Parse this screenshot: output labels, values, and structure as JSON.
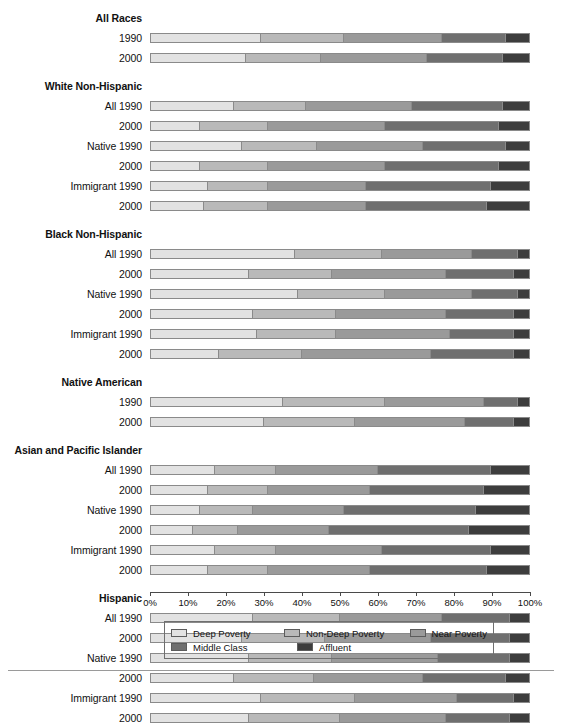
{
  "chart_data": {
    "type": "bar",
    "subtype": "stacked-horizontal-100pct",
    "title": "",
    "xlabel": "",
    "ylabel": "",
    "xlim": [
      0,
      100
    ],
    "grid": false,
    "legend_position": "bottom",
    "series": [
      {
        "name": "Deep Poverty",
        "color": "#e2e2e2"
      },
      {
        "name": "Non-Deep Poverty",
        "color": "#b9b9b9"
      },
      {
        "name": "Near Poverty",
        "color": "#9a9a9a"
      },
      {
        "name": "Middle Class",
        "color": "#6f6f6f"
      },
      {
        "name": "Affluent",
        "color": "#3d3d3d"
      }
    ],
    "tick_labels": [
      "0%",
      "10%",
      "20%",
      "30%",
      "40%",
      "50%",
      "60%",
      "70%",
      "80%",
      "90%",
      "100%"
    ],
    "tick_values": [
      0,
      10,
      20,
      30,
      40,
      50,
      60,
      70,
      80,
      90,
      100
    ],
    "groups": [
      {
        "heading": "All Races",
        "rows": [
          {
            "label": "1990",
            "values": [
              29,
              22,
              26,
              17,
              6
            ]
          },
          {
            "label": "2000",
            "values": [
              25,
              20,
              28,
              20,
              7
            ]
          }
        ]
      },
      {
        "heading": "White Non-Hispanic",
        "rows": [
          {
            "label": "All 1990",
            "values": [
              22,
              19,
              28,
              24,
              7
            ]
          },
          {
            "label": "2000",
            "values": [
              13,
              18,
              31,
              30,
              8
            ]
          },
          {
            "label": "Native 1990",
            "values": [
              24,
              20,
              28,
              22,
              6
            ]
          },
          {
            "label": "2000",
            "values": [
              13,
              18,
              31,
              30,
              8
            ]
          },
          {
            "label": "Immigrant 1990",
            "values": [
              15,
              16,
              26,
              33,
              10
            ]
          },
          {
            "label": "2000",
            "values": [
              14,
              17,
              26,
              32,
              11
            ]
          }
        ]
      },
      {
        "heading": "Black Non-Hispanic",
        "rows": [
          {
            "label": "All 1990",
            "values": [
              38,
              23,
              24,
              12,
              3
            ]
          },
          {
            "label": "2000",
            "values": [
              26,
              22,
              30,
              18,
              4
            ]
          },
          {
            "label": "Native 1990",
            "values": [
              39,
              23,
              23,
              12,
              3
            ]
          },
          {
            "label": "2000",
            "values": [
              27,
              22,
              29,
              18,
              4
            ]
          },
          {
            "label": "Immigrant 1990",
            "values": [
              28,
              21,
              30,
              17,
              4
            ]
          },
          {
            "label": "2000",
            "values": [
              18,
              22,
              34,
              22,
              4
            ]
          }
        ]
      },
      {
        "heading": "Native American",
        "rows": [
          {
            "label": "1990",
            "values": [
              35,
              27,
              26,
              9,
              3
            ]
          },
          {
            "label": "2000",
            "values": [
              30,
              24,
              29,
              13,
              4
            ]
          }
        ]
      },
      {
        "heading": "Asian and Pacific Islander",
        "rows": [
          {
            "label": "All 1990",
            "values": [
              17,
              16,
              27,
              30,
              10
            ]
          },
          {
            "label": "2000",
            "values": [
              15,
              16,
              27,
              30,
              12
            ]
          },
          {
            "label": "Native 1990",
            "values": [
              13,
              14,
              24,
              35,
              14
            ]
          },
          {
            "label": "2000",
            "values": [
              11,
              12,
              24,
              37,
              16
            ]
          },
          {
            "label": "Immigrant 1990",
            "values": [
              17,
              16,
              28,
              29,
              10
            ]
          },
          {
            "label": "2000",
            "values": [
              15,
              16,
              27,
              31,
              11
            ]
          }
        ]
      },
      {
        "heading": "Hispanic",
        "rows": [
          {
            "label": "All 1990",
            "values": [
              27,
              23,
              27,
              18,
              5
            ]
          },
          {
            "label": "2000",
            "values": [
              24,
              22,
              28,
              21,
              5
            ]
          },
          {
            "label": "Native 1990",
            "values": [
              26,
              22,
              28,
              19,
              5
            ]
          },
          {
            "label": "2000",
            "values": [
              22,
              21,
              29,
              22,
              6
            ]
          },
          {
            "label": "Immigrant 1990",
            "values": [
              29,
              25,
              27,
              15,
              4
            ]
          },
          {
            "label": "2000",
            "values": [
              26,
              24,
              28,
              17,
              5
            ]
          }
        ]
      }
    ]
  },
  "legend": {
    "items": [
      {
        "label": "Deep Poverty",
        "color": "#e2e2e2"
      },
      {
        "label": "Non-Deep Poverty",
        "color": "#b9b9b9"
      },
      {
        "label": "Near Poverty",
        "color": "#9a9a9a"
      },
      {
        "label": "Middle Class",
        "color": "#6f6f6f"
      },
      {
        "label": "Affluent",
        "color": "#3d3d3d"
      }
    ]
  }
}
